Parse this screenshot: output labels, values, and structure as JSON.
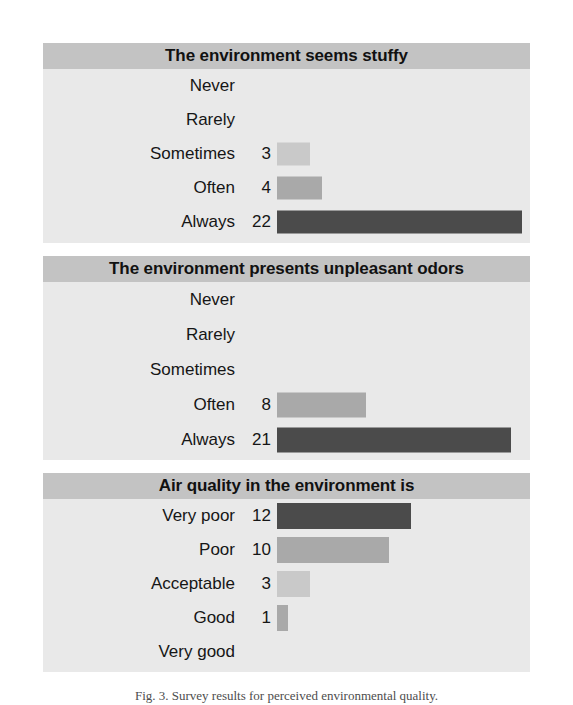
{
  "caption": "Fig. 3. Survey results for perceived environmental quality.",
  "colors": {
    "panel_background": "#e9e9e9",
    "title_band": "#c3c3c3",
    "bar_light": "#c9c9c9",
    "bar_medium": "#a9a9a9",
    "bar_dark": "#4b4b4b",
    "text": "#161616",
    "page_background": "#ffffff"
  },
  "chart_data": [
    {
      "type": "bar",
      "orientation": "horizontal",
      "title": "The environment seems stuffy",
      "xlabel": "",
      "ylabel": "",
      "categories": [
        "Never",
        "Rarely",
        "Sometimes",
        "Often",
        "Always"
      ],
      "values": [
        null,
        null,
        3,
        4,
        22
      ],
      "value_labels": [
        "",
        "",
        "3",
        "4",
        "22"
      ],
      "bar_colors": [
        "",
        "",
        "#c9c9c9",
        "#a9a9a9",
        "#4b4b4b"
      ],
      "xlim": [
        0,
        22
      ],
      "grid": false,
      "legend": false
    },
    {
      "type": "bar",
      "orientation": "horizontal",
      "title": "The environment presents unpleasant odors",
      "xlabel": "",
      "ylabel": "",
      "categories": [
        "Never",
        "Rarely",
        "Sometimes",
        "Often",
        "Always"
      ],
      "values": [
        null,
        null,
        null,
        8,
        21
      ],
      "value_labels": [
        "",
        "",
        "",
        "8",
        "21"
      ],
      "bar_colors": [
        "",
        "",
        "",
        "#a9a9a9",
        "#4b4b4b"
      ],
      "xlim": [
        0,
        21
      ],
      "grid": false,
      "legend": false
    },
    {
      "type": "bar",
      "orientation": "horizontal",
      "title": "Air quality in the environment is",
      "xlabel": "",
      "ylabel": "",
      "categories": [
        "Very poor",
        "Poor",
        "Acceptable",
        "Good",
        "Very good"
      ],
      "values": [
        12,
        10,
        3,
        1,
        null
      ],
      "value_labels": [
        "12",
        "10",
        "3",
        "1",
        ""
      ],
      "bar_colors": [
        "#4b4b4b",
        "#a9a9a9",
        "#c9c9c9",
        "#a9a9a9",
        ""
      ],
      "xlim": [
        0,
        12
      ],
      "grid": false,
      "legend": false
    }
  ]
}
